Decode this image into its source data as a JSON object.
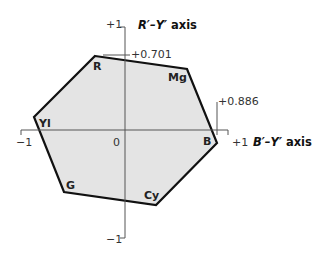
{
  "diagram": {
    "axes": {
      "vertical": {
        "label_main": "R′–Y′",
        "label_suffix": " axis",
        "top_tick": "+1",
        "bottom_tick": "−1"
      },
      "horizontal": {
        "label_main": "B′–Y′",
        "label_suffix": " axis",
        "left_tick": "−1",
        "right_tick": "+1"
      },
      "origin_label": "0"
    },
    "extents": {
      "r_max": "+0.701",
      "b_max": "+0.886"
    },
    "vertices": [
      {
        "name": "R",
        "label": "R"
      },
      {
        "name": "Mg",
        "label": "Mg"
      },
      {
        "name": "B",
        "label": "B"
      },
      {
        "name": "Cy",
        "label": "Cy"
      },
      {
        "name": "G",
        "label": "G"
      },
      {
        "name": "Yl",
        "label": "Yl"
      }
    ],
    "colors": {
      "fill": "#e4e4e4",
      "stroke": "#111111",
      "axis": "#555555"
    }
  }
}
